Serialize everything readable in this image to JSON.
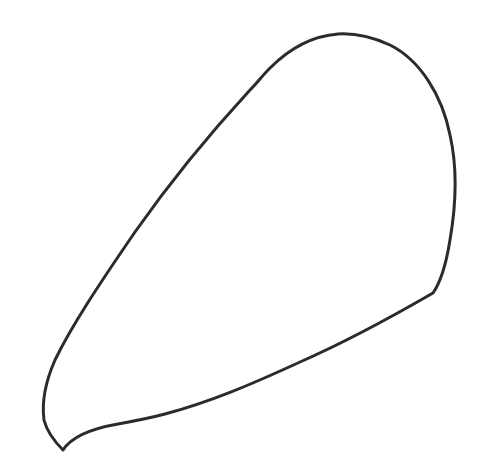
{
  "figure": {
    "background_color": "#ffffff",
    "stroke_color": "#2b2b2b",
    "shape": {
      "type": "closed-outline",
      "label": ""
    }
  }
}
